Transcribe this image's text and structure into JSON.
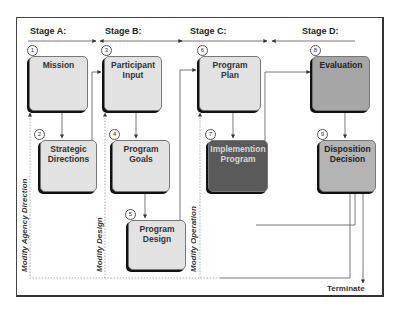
{
  "stages": [
    {
      "id": "A",
      "label": "Stage A:"
    },
    {
      "id": "B",
      "label": "Stage B:"
    },
    {
      "id": "C",
      "label": "Stage C:"
    },
    {
      "id": "D",
      "label": "Stage D:"
    }
  ],
  "boxes": [
    {
      "number": "1",
      "label_line1": "Mission",
      "label_line2": "",
      "shade": "light"
    },
    {
      "number": "2",
      "label_line1": "Strategic",
      "label_line2": "Directions",
      "shade": "light"
    },
    {
      "number": "3",
      "label_line1": "Participant",
      "label_line2": "Input",
      "shade": "light"
    },
    {
      "number": "4",
      "label_line1": "Program",
      "label_line2": "Goals",
      "shade": "light"
    },
    {
      "number": "5",
      "label_line1": "Program",
      "label_line2": "Design",
      "shade": "light"
    },
    {
      "number": "6",
      "label_line1": "Program",
      "label_line2": "Plan",
      "shade": "light"
    },
    {
      "number": "7",
      "label_line1": "Implemention",
      "label_line2": "Program",
      "shade": "dark"
    },
    {
      "number": "8",
      "label_line1": "Evaluation",
      "label_line2": "",
      "shade": "mid"
    },
    {
      "number": "9",
      "label_line1": "Disposition",
      "label_line2": "Decision",
      "shade": "midlight"
    }
  ],
  "feedback_labels": {
    "modify_agency_direction": "Modify Agency Direction",
    "modify_design": "Modify Design",
    "modify_operation": "Modify Operation"
  },
  "terminal": {
    "label": "Terminate"
  },
  "colors": {
    "light_box": "#e2e2e2",
    "dark_box": "#5a5a5a",
    "mid_box": "#a6a6a6",
    "line": "#555555"
  }
}
